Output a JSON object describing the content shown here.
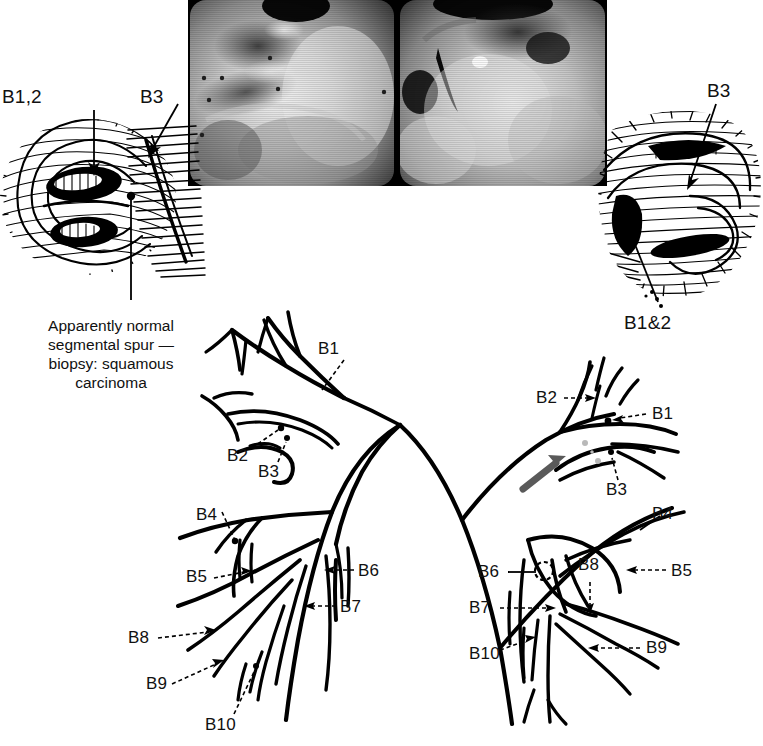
{
  "figure": {
    "type": "medical-illustration",
    "background_color": "#ffffff",
    "ink_color": "#000000",
    "pointer_arrow_color": "#5a5a5a"
  },
  "photos": {
    "left": {
      "name": "bronchoscopic-photo-left",
      "tone": "grayscale"
    },
    "right": {
      "name": "bronchoscopic-photo-right",
      "tone": "grayscale"
    }
  },
  "drawings": {
    "left": {
      "labels": [
        {
          "id": "left-drawing-b12",
          "text": "B1,2"
        },
        {
          "id": "left-drawing-b3",
          "text": "B3"
        }
      ],
      "caption": "Apparently normal segmental spur — biopsy: squamous carcinoma",
      "caption_lines": [
        "Apparently normal",
        "segmental spur —",
        "biopsy: squamous",
        "carcinoma"
      ]
    },
    "right": {
      "labels": [
        {
          "id": "right-drawing-b3",
          "text": "B3"
        },
        {
          "id": "right-drawing-b12",
          "text": "B1&2"
        }
      ]
    }
  },
  "tree": {
    "title": "Bronchial segment tree",
    "left_side": {
      "name": "left-bronchial-tree",
      "labels": [
        {
          "id": "tree-left-b1",
          "text": "B1",
          "x": 318,
          "y": 340
        },
        {
          "id": "tree-left-b2",
          "text": "B2",
          "x": 227,
          "y": 447
        },
        {
          "id": "tree-left-b3",
          "text": "B3",
          "x": 258,
          "y": 463
        },
        {
          "id": "tree-left-b4",
          "text": "B4",
          "x": 196,
          "y": 506
        },
        {
          "id": "tree-left-b5",
          "text": "B5",
          "x": 186,
          "y": 576
        },
        {
          "id": "tree-left-b6",
          "text": "B6",
          "x": 358,
          "y": 564
        },
        {
          "id": "tree-left-b7",
          "text": "B7",
          "x": 340,
          "y": 601
        },
        {
          "id": "tree-left-b8",
          "text": "B8",
          "x": 128,
          "y": 636
        },
        {
          "id": "tree-left-b9",
          "text": "B9",
          "x": 146,
          "y": 686
        },
        {
          "id": "tree-left-b10",
          "text": "B10",
          "x": 208,
          "y": 723
        }
      ]
    },
    "right_side": {
      "name": "right-bronchial-tree",
      "labels": [
        {
          "id": "tree-right-b2",
          "text": "B2",
          "x": 539,
          "y": 396
        },
        {
          "id": "tree-right-b1",
          "text": "B1",
          "x": 652,
          "y": 411
        },
        {
          "id": "tree-right-b3",
          "text": "B3",
          "x": 609,
          "y": 485
        },
        {
          "id": "tree-right-b4",
          "text": "B4",
          "x": 652,
          "y": 512
        },
        {
          "id": "tree-right-b5",
          "text": "B5",
          "x": 671,
          "y": 569
        },
        {
          "id": "tree-right-b6",
          "text": "B6",
          "x": 487,
          "y": 570
        },
        {
          "id": "tree-right-b7",
          "text": "B7",
          "x": 474,
          "y": 606
        },
        {
          "id": "tree-right-b8",
          "text": "B8",
          "x": 582,
          "y": 563
        },
        {
          "id": "tree-right-b9",
          "text": "B9",
          "x": 648,
          "y": 645
        },
        {
          "id": "tree-right-b10",
          "text": "B10",
          "x": 472,
          "y": 652
        }
      ]
    },
    "pointer_arrow": {
      "name": "lesion-pointer-arrow",
      "color": "#5a5a5a"
    },
    "marker_circle": {
      "name": "b6-dashed-circle-marker"
    }
  }
}
